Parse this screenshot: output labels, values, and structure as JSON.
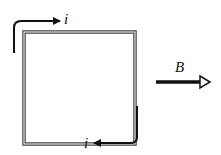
{
  "diagram": {
    "loop": {
      "shape": "square",
      "style": "double-line"
    },
    "current_label_top": "i",
    "current_label_bottom": "i",
    "field_label": "B",
    "colors": {
      "line": "#111111",
      "loop": "#555555"
    }
  }
}
